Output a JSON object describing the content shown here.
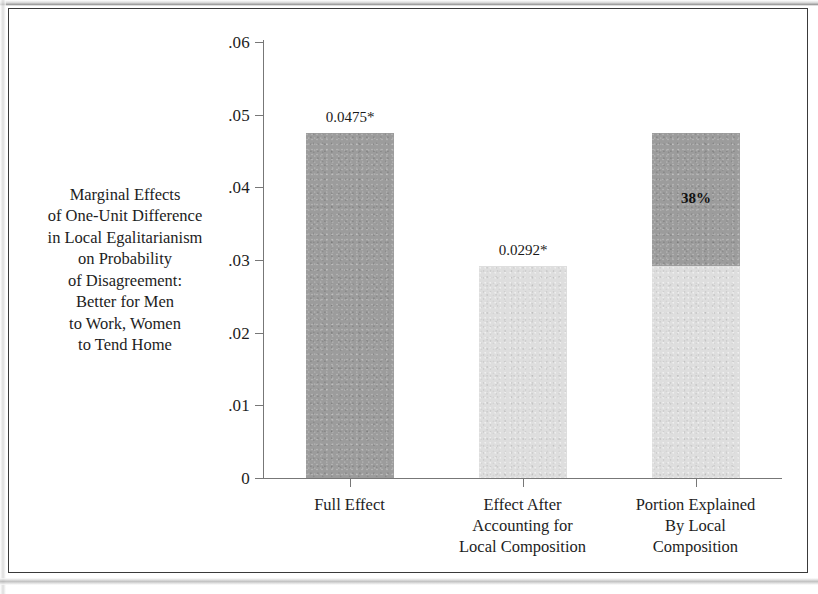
{
  "figure": {
    "background_color": "#ffffff",
    "border_color": "#3a3a3a"
  },
  "chart_data": {
    "type": "bar",
    "title": "",
    "subtitle": "",
    "xlabel": "",
    "ylabel": "Marginal Effects\nof One-Unit Difference\nin Local Egalitarianism\non Probability\nof Disagreement:\nBetter for Men\nto Work, Women\nto Tend Home",
    "categories": [
      "Full Effect",
      "Effect After\nAccounting for\nLocal Composition",
      "Portion Explained\nBy Local\nComposition"
    ],
    "values": [
      0.0475,
      0.0292,
      0.0475
    ],
    "stacked": true,
    "series": [
      {
        "name": "Light segment",
        "color": "#dedede",
        "values": [
          0,
          0.0292,
          0.0292
        ]
      },
      {
        "name": "Dark segment",
        "color": "#9c9c9c",
        "values": [
          0.0475,
          0,
          0.0183
        ]
      }
    ],
    "bar_colors": [
      "#9c9c9c",
      "#dedede",
      "#dedede"
    ],
    "data_labels": [
      "0.0475*",
      "0.0292*",
      ""
    ],
    "annotations": [
      {
        "text": "38%",
        "category": "Portion Explained\nBy Local\nComposition",
        "value": 0.038
      }
    ],
    "ylim": [
      0,
      0.06
    ],
    "yticks": [
      0,
      0.01,
      0.02,
      0.03,
      0.04,
      0.05,
      0.06
    ],
    "ytick_labels": [
      "0",
      ".01",
      ".02",
      ".03",
      ".04",
      ".05",
      ".06"
    ],
    "grid": false,
    "legend": null,
    "legend_position": "none",
    "footnote": "* denotes statistical significance"
  },
  "axis": {
    "y_tick_labels": [
      ".06",
      ".05",
      ".04",
      ".03",
      ".02",
      ".01",
      "0"
    ],
    "y_tick_values": [
      0.06,
      0.05,
      0.04,
      0.03,
      0.02,
      0.01,
      0
    ],
    "y_title_lines": [
      "Marginal Effects",
      "of One-Unit Difference",
      "in Local Egalitarianism",
      "on Probability",
      "of Disagreement:",
      "Better for Men",
      "to Work, Women",
      "to Tend Home"
    ]
  },
  "bars": [
    {
      "category_lines": [
        "Full Effect"
      ],
      "value_label": "0.0475*",
      "total": 0.0475,
      "segments": [
        {
          "from": 0,
          "to": 0.0475,
          "shade": "dark",
          "color": "#9c9c9c",
          "label": ""
        }
      ]
    },
    {
      "category_lines": [
        "Effect After",
        "Accounting for",
        "Local Composition"
      ],
      "value_label": "0.0292*",
      "total": 0.0292,
      "segments": [
        {
          "from": 0,
          "to": 0.0292,
          "shade": "light",
          "color": "#dedede",
          "label": ""
        }
      ]
    },
    {
      "category_lines": [
        "Portion Explained",
        "By Local",
        "Composition"
      ],
      "value_label": "",
      "total": 0.0475,
      "segments": [
        {
          "from": 0,
          "to": 0.0292,
          "shade": "light",
          "color": "#dedede",
          "label": ""
        },
        {
          "from": 0.0292,
          "to": 0.0475,
          "shade": "dark",
          "color": "#9c9c9c",
          "label": "38%"
        }
      ]
    }
  ]
}
